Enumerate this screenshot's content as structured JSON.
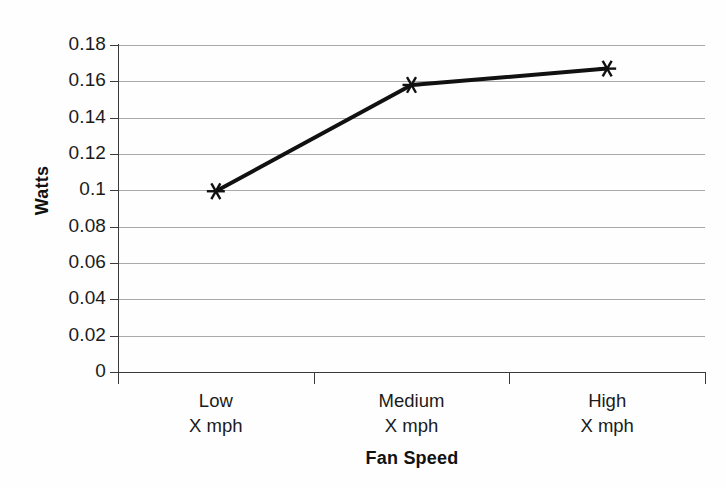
{
  "chart_data": {
    "type": "line",
    "title": "",
    "xlabel": "Fan Speed",
    "ylabel": "Watts",
    "categories": [
      "Low\nX mph",
      "Medium\nX mph",
      "High\nX mph"
    ],
    "category_labels": [
      {
        "line1": "Low",
        "line2": "X mph"
      },
      {
        "line1": "Medium",
        "line2": "X mph"
      },
      {
        "line1": "High",
        "line2": "X mph"
      }
    ],
    "series": [
      {
        "name": "Watts",
        "values": [
          0.0995,
          0.158,
          0.167
        ],
        "marker": "asterisk",
        "color": "#111111",
        "line_width": 4
      }
    ],
    "ylim": [
      0,
      0.18
    ],
    "ytick_step": 0.02,
    "yticks": [
      0,
      0.02,
      0.04,
      0.06,
      0.08,
      0.1,
      0.12,
      0.14,
      0.16,
      0.18
    ],
    "ytick_labels": [
      "0",
      "0.02",
      "0.04",
      "0.06",
      "0.08",
      "0.1",
      "0.12",
      "0.14",
      "0.16",
      "0.18"
    ],
    "grid": "horizontal",
    "legend": "none",
    "colors": {
      "series_line": "#111111",
      "gridline": "#9a9a9a",
      "axis": "#3a3a3a",
      "text": "#1b1b1b",
      "background": "#fefefe"
    }
  }
}
